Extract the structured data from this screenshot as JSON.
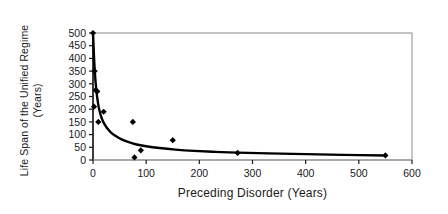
{
  "chart_data": {
    "type": "scatter",
    "title": "",
    "xlabel": "Preceding Disorder (Years)",
    "ylabel": "Life Span of the Unified Regime (Years)",
    "xlim": [
      0,
      600
    ],
    "ylim": [
      0,
      500
    ],
    "xticks": [
      0,
      100,
      200,
      300,
      400,
      500,
      600
    ],
    "yticks": [
      0,
      50,
      100,
      150,
      200,
      250,
      300,
      350,
      400,
      450,
      500
    ],
    "grid": false,
    "legend": null,
    "series": [
      {
        "name": "observations",
        "marker": "diamond",
        "color": "#000000",
        "points": [
          {
            "x": 0,
            "y": 500
          },
          {
            "x": 2,
            "y": 210
          },
          {
            "x": 3,
            "y": 350
          },
          {
            "x": 5,
            "y": 275
          },
          {
            "x": 8,
            "y": 270
          },
          {
            "x": 10,
            "y": 150
          },
          {
            "x": 20,
            "y": 190
          },
          {
            "x": 75,
            "y": 150
          },
          {
            "x": 78,
            "y": 10
          },
          {
            "x": 90,
            "y": 38
          },
          {
            "x": 150,
            "y": 78
          },
          {
            "x": 272,
            "y": 28
          },
          {
            "x": 550,
            "y": 18
          }
        ]
      }
    ],
    "trendline": {
      "name": "fitted decay curve",
      "color": "#000000",
      "points": [
        {
          "x": 0,
          "y": 500
        },
        {
          "x": 2,
          "y": 400
        },
        {
          "x": 4,
          "y": 330
        },
        {
          "x": 6,
          "y": 280
        },
        {
          "x": 9,
          "y": 230
        },
        {
          "x": 12,
          "y": 196
        },
        {
          "x": 16,
          "y": 167
        },
        {
          "x": 20,
          "y": 147
        },
        {
          "x": 26,
          "y": 127
        },
        {
          "x": 33,
          "y": 110
        },
        {
          "x": 42,
          "y": 95
        },
        {
          "x": 53,
          "y": 82
        },
        {
          "x": 66,
          "y": 71
        },
        {
          "x": 82,
          "y": 61
        },
        {
          "x": 100,
          "y": 54
        },
        {
          "x": 125,
          "y": 47
        },
        {
          "x": 155,
          "y": 41
        },
        {
          "x": 190,
          "y": 36
        },
        {
          "x": 230,
          "y": 32
        },
        {
          "x": 272,
          "y": 29
        },
        {
          "x": 330,
          "y": 26
        },
        {
          "x": 400,
          "y": 23
        },
        {
          "x": 470,
          "y": 20
        },
        {
          "x": 550,
          "y": 18
        }
      ]
    }
  },
  "axes": {
    "y_title_line1": "Life Span of the Unified Regime",
    "y_title_line2": "(Years)",
    "x_title": "Preceding Disorder (Years)"
  },
  "tick_text": {
    "x": [
      "0",
      "100",
      "200",
      "300",
      "400",
      "500",
      "600"
    ],
    "y": [
      "500",
      "450",
      "400",
      "350",
      "300",
      "250",
      "200",
      "150",
      "100",
      "50",
      "0"
    ]
  }
}
